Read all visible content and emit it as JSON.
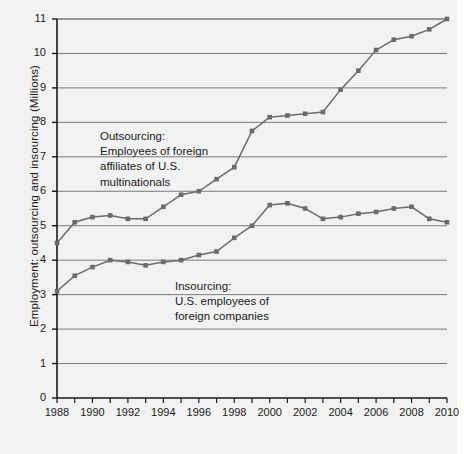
{
  "chart_data": {
    "type": "line",
    "title": "",
    "xlabel": "",
    "ylabel": "Employment: outsourcing and insourcing (Millions)",
    "xlim": [
      1988,
      2010
    ],
    "ylim": [
      0,
      11
    ],
    "yticks": [
      0,
      1,
      2,
      3,
      4,
      5,
      6,
      7,
      8,
      9,
      10,
      11
    ],
    "ytick_labels": [
      "0",
      "1",
      "2",
      "3",
      "4",
      "5",
      "6",
      "7",
      "8",
      "9",
      "10",
      "11"
    ],
    "xticks": [
      1988,
      1989,
      1990,
      1991,
      1992,
      1993,
      1994,
      1995,
      1996,
      1997,
      1998,
      1999,
      2000,
      2001,
      2002,
      2003,
      2004,
      2005,
      2006,
      2007,
      2008,
      2009,
      2010
    ],
    "xtick_labels_shown": [
      "1988",
      "1990",
      "1992",
      "1994",
      "1996",
      "1998",
      "2000",
      "2002",
      "2004",
      "2006",
      "2008",
      "2010"
    ],
    "grid": "horizontal",
    "legend": "inline-annotations",
    "marker": "square",
    "series_color": "#6b6b6b",
    "plot_bg": "#f2f2f2",
    "x": [
      1988,
      1989,
      1990,
      1991,
      1992,
      1993,
      1994,
      1995,
      1996,
      1997,
      1998,
      1999,
      2000,
      2001,
      2002,
      2003,
      2004,
      2005,
      2006,
      2007,
      2008,
      2009,
      2010
    ],
    "series": [
      {
        "name": "Outsourcing: Employees of foreign affiliates of U.S. multinationals",
        "values": [
          4.5,
          5.1,
          5.25,
          5.3,
          5.2,
          5.2,
          5.55,
          5.9,
          6.0,
          6.35,
          6.7,
          7.75,
          8.15,
          8.2,
          8.25,
          8.3,
          8.95,
          9.5,
          10.1,
          10.4,
          10.5,
          10.7,
          11.0
        ]
      },
      {
        "name": "Insourcing: U.S. employees of foreign companies",
        "values": [
          3.1,
          3.55,
          3.8,
          4.0,
          3.95,
          3.85,
          3.95,
          4.0,
          4.15,
          4.25,
          4.65,
          5.0,
          5.6,
          5.65,
          5.5,
          5.2,
          5.25,
          5.35,
          5.4,
          5.5,
          5.55,
          5.2,
          5.1
        ]
      }
    ],
    "annotations": [
      {
        "id": "outsourcing",
        "text": "Outsourcing:\nEmployees of foreign\naffiliates of U.S.\nmultinationals"
      },
      {
        "id": "insourcing",
        "text": "Insourcing:\nU.S. employees of\nforeign companies"
      }
    ]
  }
}
